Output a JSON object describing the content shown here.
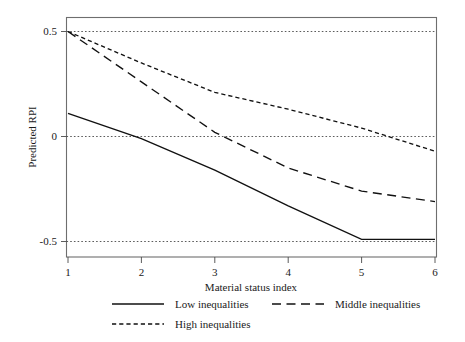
{
  "chart_data": {
    "type": "line",
    "title": "",
    "xlabel": "Material status index",
    "ylabel": "Predicted RPI",
    "xlim": [
      1,
      6
    ],
    "ylim": [
      -0.58,
      0.58
    ],
    "xticks": [
      1,
      2,
      3,
      4,
      5,
      6
    ],
    "xtick_labels": [
      "1",
      "2",
      "3",
      "4",
      "5",
      "6"
    ],
    "yticks": [
      0.5,
      0,
      -0.5
    ],
    "ytick_labels": [
      "0.5",
      "0",
      "-0.5"
    ],
    "grid": "horizontal dotted gridlines at y = 0.5, 0, -0.5",
    "legend_position": "below axes, two columns",
    "x": [
      1,
      2,
      3,
      4,
      5,
      6
    ],
    "series": [
      {
        "name": "Low inequalities",
        "style": "solid",
        "values": [
          0.11,
          -0.01,
          -0.16,
          -0.33,
          -0.49,
          -0.49
        ]
      },
      {
        "name": "Middle inequalities",
        "style": "long-dash",
        "values": [
          0.5,
          0.26,
          0.02,
          -0.15,
          -0.26,
          -0.31
        ]
      },
      {
        "name": "High inequalities",
        "style": "short-dash",
        "values": [
          0.5,
          0.35,
          0.21,
          0.13,
          0.04,
          -0.07
        ]
      }
    ],
    "annotations": []
  },
  "legend": {
    "items": [
      {
        "label": "Low inequalities",
        "style": "solid"
      },
      {
        "label": "Middle inequalities",
        "style": "long-dash"
      },
      {
        "label": "High inequalities",
        "style": "short-dash"
      }
    ]
  }
}
